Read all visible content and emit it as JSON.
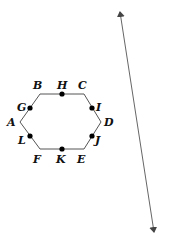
{
  "colors": {
    "background": "#ffffff",
    "stroke": "#555555",
    "point": "#000000",
    "text": "#111111",
    "line": "#666666"
  },
  "hexagon": {
    "vertices": [
      {
        "name": "A",
        "x": 20,
        "y": 122,
        "label_x": 7,
        "label_y": 126
      },
      {
        "name": "B",
        "x": 40,
        "y": 94,
        "label_x": 33,
        "label_y": 89
      },
      {
        "name": "C",
        "x": 84,
        "y": 94,
        "label_x": 78,
        "label_y": 89
      },
      {
        "name": "D",
        "x": 101,
        "y": 122,
        "label_x": 104,
        "label_y": 126
      },
      {
        "name": "E",
        "x": 84,
        "y": 149,
        "label_x": 77,
        "label_y": 163
      },
      {
        "name": "F",
        "x": 40,
        "y": 149,
        "label_x": 33,
        "label_y": 163
      }
    ],
    "midpoints": [
      {
        "name": "H",
        "x": 62,
        "y": 94,
        "label_x": 57,
        "label_y": 89
      },
      {
        "name": "I",
        "x": 92,
        "y": 108,
        "label_x": 96,
        "label_y": 111
      },
      {
        "name": "J",
        "x": 92,
        "y": 136,
        "label_x": 95,
        "label_y": 144
      },
      {
        "name": "K",
        "x": 62,
        "y": 149,
        "label_x": 56,
        "label_y": 163
      },
      {
        "name": "L",
        "x": 30,
        "y": 136,
        "label_x": 18,
        "label_y": 144
      },
      {
        "name": "G",
        "x": 30,
        "y": 108,
        "label_x": 17,
        "label_y": 111
      }
    ]
  },
  "line": {
    "x1": 120,
    "y1": 12,
    "x2": 154,
    "y2": 232,
    "arrows": "both"
  }
}
